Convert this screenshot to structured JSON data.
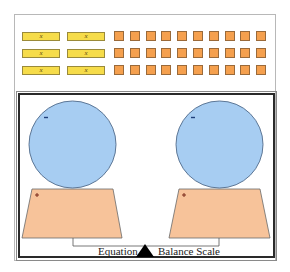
{
  "diagram": {
    "title": "Equation Balance Scale",
    "label_left": "Equation",
    "label_right": "Balance Scale",
    "tile_rows": 3,
    "x_tiles_per_row": 2,
    "unit_tiles_per_row": 10,
    "x_tile_label": "x",
    "x_tile_color": "#f6dc4a",
    "unit_tile_color": "#f5a04e",
    "left_pan": {
      "sphere_sign": "−",
      "pan_sign": "+",
      "sphere_color": "#a7cdf2",
      "pan_color": "#f7c39a"
    },
    "right_pan": {
      "sphere_sign": "−",
      "pan_sign": "+",
      "sphere_color": "#a7cdf2",
      "pan_color": "#f7c39a"
    }
  },
  "x_tiles": [
    {
      "label": "x"
    },
    {
      "label": "x"
    },
    {
      "label": "x"
    },
    {
      "label": "x"
    },
    {
      "label": "x"
    },
    {
      "label": "x"
    }
  ]
}
